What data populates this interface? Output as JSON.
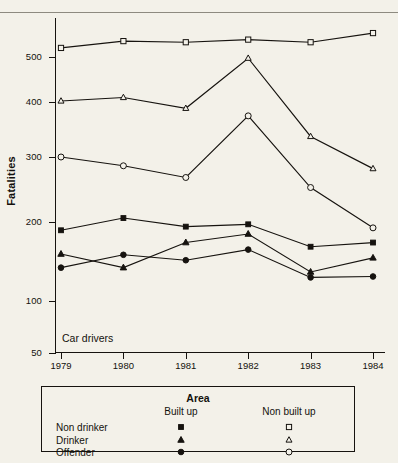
{
  "chart_data": {
    "type": "line",
    "title": "",
    "annotation": "Car drivers",
    "xlabel": "",
    "ylabel": "Fatalities",
    "categories": [
      "1979",
      "1980",
      "1981",
      "1982",
      "1983",
      "1984"
    ],
    "x_ticks": [
      "1979",
      "1980",
      "1981",
      "1982",
      "1983",
      "1984"
    ],
    "y_ticks": [
      50,
      100,
      200,
      300,
      400,
      500
    ],
    "y_tick_labels": [
      "50",
      "100",
      "200",
      "300",
      "400",
      "500"
    ],
    "ylim": [
      50,
      620
    ],
    "y_scale": "log",
    "grid": false,
    "legend_position": "below-plot",
    "series": [
      {
        "name": "Non drinker, Built up",
        "group": "Non drinker",
        "area": "Built up",
        "marker": "filled-square",
        "values": [
          186,
          205,
          192,
          196,
          161,
          167
        ]
      },
      {
        "name": "Drinker, Built up",
        "group": "Drinker",
        "area": "Built up",
        "marker": "filled-triangle",
        "values": [
          151,
          134,
          167,
          180,
          129,
          146
        ]
      },
      {
        "name": "Offender, Built up",
        "group": "Offender",
        "area": "Built up",
        "marker": "filled-circle",
        "values": [
          134,
          150,
          143,
          157,
          123,
          124
        ]
      },
      {
        "name": "Non drinker, Non built up",
        "group": "Non drinker",
        "area": "Non built up",
        "marker": "open-square",
        "values": [
          523,
          541,
          538,
          545,
          538,
          563
        ]
      },
      {
        "name": "Drinker, Non built up",
        "group": "Drinker",
        "area": "Non built up",
        "marker": "open-triangle",
        "values": [
          402,
          409,
          387,
          497,
          334,
          279
        ]
      },
      {
        "name": "Offender, Non built up",
        "group": "Offender",
        "area": "Non built up",
        "marker": "open-circle",
        "values": [
          300,
          284,
          264,
          372,
          248,
          190
        ]
      }
    ]
  },
  "legend": {
    "title": "Area",
    "columns": [
      "Built up",
      "Non built up"
    ],
    "rows": [
      {
        "label": "Non drinker",
        "built_up_marker": "filled-square",
        "non_built_up_marker": "open-square"
      },
      {
        "label": "Drinker",
        "built_up_marker": "filled-triangle",
        "non_built_up_marker": "open-triangle"
      },
      {
        "label": "Offender",
        "built_up_marker": "filled-circle",
        "non_built_up_marker": "open-circle"
      }
    ]
  },
  "colors": {
    "background": "#f3f1e9",
    "ink": "#16130f",
    "rule": "#8d8a80"
  }
}
